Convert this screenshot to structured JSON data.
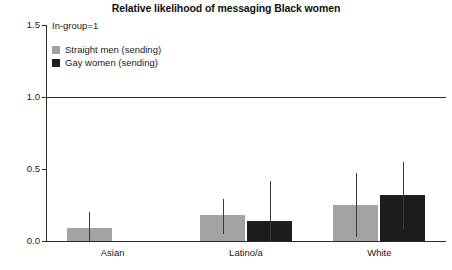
{
  "chart_data": {
    "type": "bar",
    "title": "Relative likelihood of messaging Black women",
    "xlabel": "",
    "ylabel": "",
    "ylim": [
      0.0,
      1.5
    ],
    "yticks": [
      "0.0",
      "0.5",
      "1.0",
      "1.5"
    ],
    "ytick_values": [
      0.0,
      0.5,
      1.0,
      1.5
    ],
    "grid": false,
    "legend_position": "top-left",
    "annotation": "In-group=1",
    "reference_line": 1.0,
    "categories": [
      "Asian",
      "Latino/a",
      "White"
    ],
    "series": [
      {
        "name": "Straight men (sending)",
        "color": "#a3a3a3",
        "values": [
          0.09,
          0.18,
          0.25
        ],
        "error_upper": [
          0.2,
          0.29,
          0.47
        ],
        "error_lower": [
          0.0,
          0.05,
          0.03
        ]
      },
      {
        "name": "Gay women (sending)",
        "color": "#1c1c1c",
        "values": [
          0.0,
          0.14,
          0.32
        ],
        "error_upper": [
          0.0,
          0.42,
          0.55
        ],
        "error_lower": [
          0.0,
          0.0,
          0.08
        ]
      }
    ]
  },
  "colors": {
    "straight_men": "#a3a3a3",
    "gay_women": "#1c1c1c",
    "axis": "#2b2b2b",
    "error": "#3a3a3a",
    "text": "#1a1a1a",
    "background": "#ffffff"
  }
}
